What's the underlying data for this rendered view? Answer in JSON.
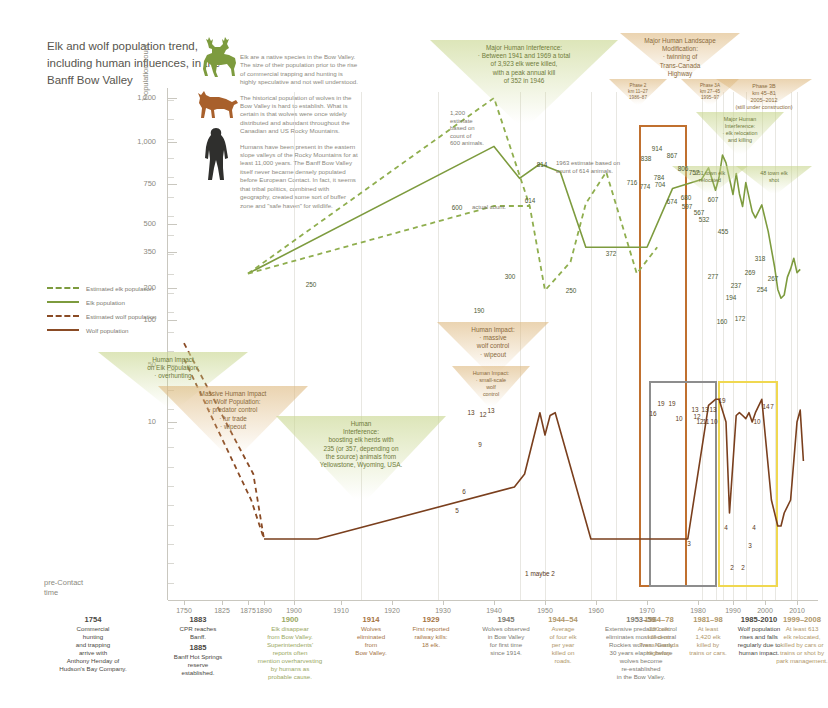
{
  "title": "Elk and wolf population trend, including human influences, in the Banff Bow Valley",
  "intro": [
    "Elk are a native species in the Bow Valley. The size of their population prior to the rise of commercial trapping and hunting is highly speculative and not well understood.",
    "The historical population of wolves in the Bow Valley is hard to establish. What is certain is that wolves were once widely distributed and abundant throughout the Canadian and US Rocky Mountains.",
    "Humans have been present in the eastern slope valleys of the Rocky Mountains for at least 11,000 years. The Banff Bow Valley itself never became densely populated before European Contact. In fact, it seems that tribal politics, combined with geography, created some sort of buffer zone and \"safe haven\" for wildlife."
  ],
  "legend": [
    {
      "label": "Estimated elk population",
      "style": "dash",
      "color": "#8fae4e"
    },
    {
      "label": "Elk population",
      "style": "solid",
      "color": "#7d9b3e"
    },
    {
      "label": "Estimated wolf population",
      "style": "dash",
      "color": "#8a4b25"
    },
    {
      "label": "Wolf population",
      "style": "solid",
      "color": "#7a3f1d"
    }
  ],
  "axes": {
    "ylabel": "Population count",
    "yticks": [
      1200,
      1000,
      750,
      500,
      350,
      200,
      100,
      50,
      10
    ],
    "xticks": [
      1750,
      1825,
      1875,
      1890,
      1900,
      1910,
      1920,
      1930,
      1940,
      1950,
      1960,
      1970,
      1980,
      1990,
      2000,
      2010
    ],
    "precontact": "pre-Contact\ntime"
  },
  "chart_data": {
    "type": "line",
    "title": "Elk and wolf population trend, including human influences, in the Banff Bow Valley",
    "xlabel": "Year",
    "ylabel": "Population count",
    "yscale": "custom-log-like",
    "yticks": [
      10,
      50,
      100,
      200,
      350,
      500,
      750,
      1000,
      1200
    ],
    "xlim": [
      1750,
      2012
    ],
    "grid": false,
    "legend_position": "left",
    "series": [
      {
        "name": "Estimated elk population",
        "style": "dashed",
        "color": "#8fae4e",
        "points": [
          [
            1875,
            250
          ],
          [
            1940,
            1200
          ],
          [
            1947,
            600
          ],
          [
            1950,
            190
          ],
          [
            1955,
            300
          ],
          [
            1958,
            614
          ],
          [
            1962,
            814
          ],
          [
            1968,
            250
          ],
          [
            1972,
            372
          ]
        ]
      },
      {
        "name": "Elk population",
        "style": "solid",
        "color": "#7d9b3e",
        "points": [
          [
            1875,
            250
          ],
          [
            1940,
            970
          ],
          [
            1945,
            780
          ],
          [
            1949,
            860
          ],
          [
            1953,
            814
          ],
          [
            1958,
            372
          ],
          [
            1970,
            372
          ],
          [
            1975,
            716
          ],
          [
            1981,
            774
          ],
          [
            1983,
            838
          ],
          [
            1985,
            704
          ],
          [
            1986,
            784
          ],
          [
            1987,
            914
          ],
          [
            1988,
            867
          ],
          [
            1990,
            674
          ],
          [
            1991,
            806
          ],
          [
            1992,
            680
          ],
          [
            1993,
            597
          ],
          [
            1994,
            757
          ],
          [
            1996,
            567
          ],
          [
            1997,
            532
          ],
          [
            1999,
            607
          ],
          [
            2001,
            455
          ],
          [
            2003,
            277
          ],
          [
            2004,
            194
          ],
          [
            2005,
            160
          ],
          [
            2006,
            172
          ],
          [
            2007,
            237
          ],
          [
            2008,
            269
          ],
          [
            2009,
            318
          ],
          [
            2010,
            254
          ],
          [
            2011,
            267
          ]
        ]
      },
      {
        "name": "Estimated wolf population",
        "style": "dashed",
        "color": "#8a4b25",
        "points": [
          [
            1750,
            70
          ],
          [
            1880,
            6
          ],
          [
            1890,
            1
          ]
        ]
      },
      {
        "name": "Wolf population",
        "style": "solid",
        "color": "#7a3f1d",
        "points": [
          [
            1890,
            1
          ],
          [
            1905,
            1
          ],
          [
            1944,
            5
          ],
          [
            1946,
            6
          ],
          [
            1949,
            13
          ],
          [
            1950,
            9
          ],
          [
            1951,
            12
          ],
          [
            1952,
            13
          ],
          [
            1959,
            1
          ],
          [
            1962,
            1
          ],
          [
            1978,
            1
          ],
          [
            1983,
            16
          ],
          [
            1985,
            19
          ],
          [
            1986,
            19
          ],
          [
            1988,
            10
          ],
          [
            1989,
            3
          ],
          [
            1991,
            12
          ],
          [
            1992,
            13
          ],
          [
            1993,
            12
          ],
          [
            1994,
            11
          ],
          [
            1995,
            13
          ],
          [
            1996,
            10
          ],
          [
            1997,
            13
          ],
          [
            1999,
            19
          ],
          [
            2002,
            4
          ],
          [
            2004,
            2
          ],
          [
            2005,
            2
          ],
          [
            2006,
            3
          ],
          [
            2008,
            4
          ],
          [
            2010,
            10
          ],
          [
            2011,
            14
          ],
          [
            2012,
            7
          ]
        ]
      }
    ],
    "elk_value_labels": [
      716,
      774,
      838,
      704,
      784,
      914,
      867,
      674,
      806,
      680,
      597,
      757,
      567,
      532,
      607,
      455,
      277,
      237,
      194,
      160,
      172,
      269,
      318,
      254,
      267
    ],
    "wolf_value_labels": [
      16,
      19,
      19,
      10,
      3,
      12,
      13,
      12,
      11,
      13,
      10,
      13,
      19,
      4,
      2,
      2,
      3,
      4,
      10,
      14,
      7
    ],
    "estimate_labels": [
      250,
      1200,
      600,
      190,
      300,
      614,
      814,
      250,
      372
    ]
  },
  "point_labels": [
    {
      "text": "250",
      "x": 311,
      "y": 284,
      "kind": "elk"
    },
    {
      "text": "1,200\nestimate\nbased on\ncount of\n600 animals.",
      "x": 450,
      "y": 110,
      "kind": "note"
    },
    {
      "text": "600",
      "x": 457,
      "y": 207,
      "kind": "elk"
    },
    {
      "text": "actual count.",
      "x": 472,
      "y": 208,
      "kind": "note-inline"
    },
    {
      "text": "190",
      "x": 479,
      "y": 310,
      "kind": "elk"
    },
    {
      "text": "300",
      "x": 510,
      "y": 276,
      "kind": "elk"
    },
    {
      "text": "614",
      "x": 530,
      "y": 200,
      "kind": "elk"
    },
    {
      "text": "814",
      "x": 542,
      "y": 164,
      "kind": "elk"
    },
    {
      "text": "1963 estimate based on\ncount of 614 animals.",
      "x": 556,
      "y": 160,
      "kind": "note"
    },
    {
      "text": "250",
      "x": 571,
      "y": 290,
      "kind": "elk"
    },
    {
      "text": "372",
      "x": 611,
      "y": 253,
      "kind": "elk"
    },
    {
      "text": "716",
      "x": 632,
      "y": 182,
      "kind": "elk"
    },
    {
      "text": "774",
      "x": 645,
      "y": 186,
      "kind": "elk"
    },
    {
      "text": "838",
      "x": 646,
      "y": 158,
      "kind": "elk"
    },
    {
      "text": "704",
      "x": 660,
      "y": 184,
      "kind": "elk"
    },
    {
      "text": "784",
      "x": 659,
      "y": 177,
      "kind": "elk"
    },
    {
      "text": "914",
      "x": 657,
      "y": 148,
      "kind": "elk"
    },
    {
      "text": "867",
      "x": 672,
      "y": 155,
      "kind": "elk"
    },
    {
      "text": "674",
      "x": 672,
      "y": 201,
      "kind": "elk"
    },
    {
      "text": "806",
      "x": 683,
      "y": 168,
      "kind": "elk"
    },
    {
      "text": "680",
      "x": 686,
      "y": 197,
      "kind": "elk"
    },
    {
      "text": "597",
      "x": 687,
      "y": 206,
      "kind": "elk"
    },
    {
      "text": "757",
      "x": 694,
      "y": 172,
      "kind": "elk"
    },
    {
      "text": "567",
      "x": 699,
      "y": 212,
      "kind": "elk"
    },
    {
      "text": "532",
      "x": 704,
      "y": 219,
      "kind": "elk"
    },
    {
      "text": "607",
      "x": 713,
      "y": 199,
      "kind": "elk"
    },
    {
      "text": "455",
      "x": 723,
      "y": 231,
      "kind": "elk"
    },
    {
      "text": "277",
      "x": 713,
      "y": 276,
      "kind": "elk"
    },
    {
      "text": "237",
      "x": 736,
      "y": 285,
      "kind": "elk"
    },
    {
      "text": "194",
      "x": 731,
      "y": 297,
      "kind": "elk"
    },
    {
      "text": "160",
      "x": 722,
      "y": 321,
      "kind": "elk"
    },
    {
      "text": "172",
      "x": 740,
      "y": 318,
      "kind": "elk"
    },
    {
      "text": "269",
      "x": 750,
      "y": 272,
      "kind": "elk"
    },
    {
      "text": "318",
      "x": 760,
      "y": 258,
      "kind": "elk"
    },
    {
      "text": "254",
      "x": 762,
      "y": 289,
      "kind": "elk"
    },
    {
      "text": "267",
      "x": 773,
      "y": 278,
      "kind": "elk"
    },
    {
      "text": "5",
      "x": 457,
      "y": 510,
      "kind": "wolf"
    },
    {
      "text": "6",
      "x": 464,
      "y": 491,
      "kind": "wolf"
    },
    {
      "text": "13",
      "x": 471,
      "y": 412,
      "kind": "wolf"
    },
    {
      "text": "9",
      "x": 480,
      "y": 444,
      "kind": "wolf"
    },
    {
      "text": "12",
      "x": 483,
      "y": 414,
      "kind": "wolf"
    },
    {
      "text": "13",
      "x": 491,
      "y": 410,
      "kind": "wolf"
    },
    {
      "text": "1 maybe 2",
      "x": 540,
      "y": 573,
      "kind": "wolf"
    },
    {
      "text": "16",
      "x": 653,
      "y": 413,
      "kind": "wolf"
    },
    {
      "text": "19",
      "x": 661,
      "y": 403,
      "kind": "wolf"
    },
    {
      "text": "19",
      "x": 672,
      "y": 403,
      "kind": "wolf"
    },
    {
      "text": "10",
      "x": 679,
      "y": 418,
      "kind": "wolf"
    },
    {
      "text": "3",
      "x": 689,
      "y": 543,
      "kind": "wolf"
    },
    {
      "text": "12",
      "x": 697,
      "y": 416,
      "kind": "wolf"
    },
    {
      "text": "13",
      "x": 695,
      "y": 409,
      "kind": "wolf"
    },
    {
      "text": "12",
      "x": 700,
      "y": 421,
      "kind": "wolf"
    },
    {
      "text": "11",
      "x": 706,
      "y": 421,
      "kind": "wolf"
    },
    {
      "text": "13",
      "x": 705,
      "y": 409,
      "kind": "wolf"
    },
    {
      "text": "10",
      "x": 714,
      "y": 421,
      "kind": "wolf"
    },
    {
      "text": "13",
      "x": 713,
      "y": 409,
      "kind": "wolf"
    },
    {
      "text": "19",
      "x": 722,
      "y": 400,
      "kind": "wolf"
    },
    {
      "text": "4",
      "x": 726,
      "y": 527,
      "kind": "wolf"
    },
    {
      "text": "2",
      "x": 732,
      "y": 567,
      "kind": "wolf"
    },
    {
      "text": "2",
      "x": 743,
      "y": 567,
      "kind": "wolf"
    },
    {
      "text": "3",
      "x": 750,
      "y": 545,
      "kind": "wolf"
    },
    {
      "text": "4",
      "x": 754,
      "y": 527,
      "kind": "wolf"
    },
    {
      "text": "10",
      "x": 757,
      "y": 421,
      "kind": "wolf"
    },
    {
      "text": "14",
      "x": 766,
      "y": 406,
      "kind": "wolf"
    },
    {
      "text": "7",
      "x": 772,
      "y": 406,
      "kind": "wolf"
    }
  ],
  "callouts": [
    {
      "id": "human-impact-elk",
      "text": "Human Impact\non Elk Population:\n· overhunting",
      "theme": "green",
      "x": 98,
      "y": 352,
      "w": 150,
      "h": 60
    },
    {
      "id": "massive-human-impact-wolf",
      "text": "Massive Human Impact\non Wolf Population:\n· predator control\n· fur trade\n· wipeout",
      "theme": "tan",
      "x": 158,
      "y": 386,
      "w": 150,
      "h": 76
    },
    {
      "id": "human-interference-elk-herds",
      "text": "Human\nInterference:\nboosting elk herds with\n235 (or 357, depending on\nthe source) animals from\nYellowstone, Wyoming, USA.",
      "theme": "green",
      "x": 276,
      "y": 416,
      "w": 170,
      "h": 90
    },
    {
      "id": "major-human-interference-kill",
      "text": "Major Human Interference:\n· Between 1941 and 1969 a total\nof 3,923 elk were killed,\nwith a peak annual kill\nof 352 in 1946",
      "theme": "green",
      "x": 430,
      "y": 40,
      "w": 188,
      "h": 90
    },
    {
      "id": "human-impact-massive-wolf-control",
      "text": "Human Impact:\n· massive\nwolf control\n· wipeout",
      "theme": "tan",
      "x": 437,
      "y": 322,
      "w": 112,
      "h": 56
    },
    {
      "id": "human-impact-small-scale-wolf-control",
      "text": "Human Impact:\n· small-scale\nwolf\ncontrol",
      "theme": "tan",
      "x": 452,
      "y": 366,
      "w": 78,
      "h": 44
    },
    {
      "id": "major-human-landscape-modification",
      "text": "Major Human Landscape\nModification:\n· twinning of\nTrans-Canada\nHighway",
      "theme": "tan",
      "x": 620,
      "y": 33,
      "w": 120,
      "h": 50
    },
    {
      "id": "phase-2",
      "text": "Phase 2\nkm 11–27\n1986–87",
      "theme": "tan",
      "x": 609,
      "y": 79,
      "w": 58,
      "h": 28
    },
    {
      "id": "phase-3a",
      "text": "Phase 3A\nkm 27–45\n1995–97",
      "theme": "tan",
      "x": 681,
      "y": 79,
      "w": 58,
      "h": 28
    },
    {
      "id": "phase-3b",
      "text": "Phase 3B\nkm 45–81\n2005–2012\n(still under construction)",
      "theme": "tan",
      "x": 716,
      "y": 79,
      "w": 96,
      "h": 32
    },
    {
      "id": "major-human-interference-relocation",
      "text": "Major Human\nInterference:\n· elk relocation\nand killing",
      "theme": "green",
      "x": 696,
      "y": 112,
      "w": 88,
      "h": 46
    },
    {
      "id": "elk-relocated-251",
      "text": "251 town elk\nrelocated",
      "theme": "green",
      "x": 672,
      "y": 166,
      "w": 76,
      "h": 30
    },
    {
      "id": "elk-shot-48",
      "text": "48 town elk\nshot",
      "theme": "green",
      "x": 736,
      "y": 166,
      "w": 76,
      "h": 30
    }
  ],
  "highlights": [
    {
      "id": "orange-box",
      "color": "#c0702f",
      "x": 639,
      "y": 125,
      "w": 48,
      "h": 462
    },
    {
      "id": "grey-box",
      "color": "#8d8d8d",
      "x": 649,
      "y": 381,
      "w": 68,
      "h": 206
    },
    {
      "id": "yellow-box",
      "color": "#f0d850",
      "x": 718,
      "y": 381,
      "w": 60,
      "h": 206
    }
  ],
  "timeline": [
    {
      "id": "1754",
      "year": "1754",
      "text": "Commercial\nhunting\nand trapping\narrive with\nAnthony Henday of\nHudson's Bay Company.",
      "x": 33,
      "y": 616,
      "w": 120,
      "color": "#4a4842"
    },
    {
      "id": "1883-1885",
      "year": "1883",
      "text": "CPR reaches\nBanff.",
      "year2": "1885",
      "text2": "Banff Hot Springs\nreserve\nestablished.",
      "x": 155,
      "y": 616,
      "w": 86,
      "color": "#4a4842"
    },
    {
      "id": "1900",
      "year": "1900",
      "text": "Elk disappear\nfrom Bow Valley.\nSuperintendents'\nreports often\nmention overharvesting\nby humans as\nprobable cause.",
      "x": 236,
      "y": 616,
      "w": 108,
      "color": "#9aa863"
    },
    {
      "id": "1914",
      "year": "1914",
      "text": "Wolves\neliminated\nfrom\nBow Valley.",
      "x": 340,
      "y": 616,
      "w": 62,
      "color": "#a5733f"
    },
    {
      "id": "1929",
      "year": "1929",
      "text": "First reported\nrailway kills:\n18 elk.",
      "x": 395,
      "y": 616,
      "w": 72,
      "color": "#a5733f"
    },
    {
      "id": "1945",
      "year": "1945",
      "text": "Wolves observed\nin Bow Valley\nfor first time\nsince 1914.",
      "x": 465,
      "y": 616,
      "w": 82,
      "color": "#7d7b72"
    },
    {
      "id": "1944-54",
      "year": "1944–54",
      "text": "Average\nof four elk\nper year\nkilled on\nroads.",
      "x": 534,
      "y": 616,
      "w": 58,
      "color": "#b0976a"
    },
    {
      "id": "1953-59",
      "year": "1953–59",
      "text": "Extensive predator control\neliminates most of central\nRockies wolves. Nearly\n30 years elapse before\nwolves become\nre-established\nin the Bow Valley.",
      "x": 582,
      "y": 616,
      "w": 118,
      "color": "#7d7b72"
    },
    {
      "id": "1964-78",
      "year": "1964–78",
      "text": "280 elk\nkilled on\nTrans-Canada\nHighway.",
      "x": 625,
      "y": 616,
      "w": 68,
      "color": "#b0976a"
    },
    {
      "id": "1981-98",
      "year": "1981–98",
      "text": "At least\n1,420 elk\nkilled by\ntrains or cars.",
      "x": 677,
      "y": 616,
      "w": 62,
      "color": "#b0976a"
    },
    {
      "id": "1985-2010",
      "year": "1985-2010",
      "text": "Wolf population\nrises and falls\nregularly due to\nhuman impact.",
      "x": 719,
      "y": 616,
      "w": 80,
      "color": "#4a4842"
    },
    {
      "id": "1999-2008",
      "year": "1999–2008",
      "text": "At least 613\nelk relocated,\nkilled by cars or\ntrains or shot by\npark management.",
      "x": 761,
      "y": 616,
      "w": 82,
      "color": "#b0976a"
    }
  ]
}
